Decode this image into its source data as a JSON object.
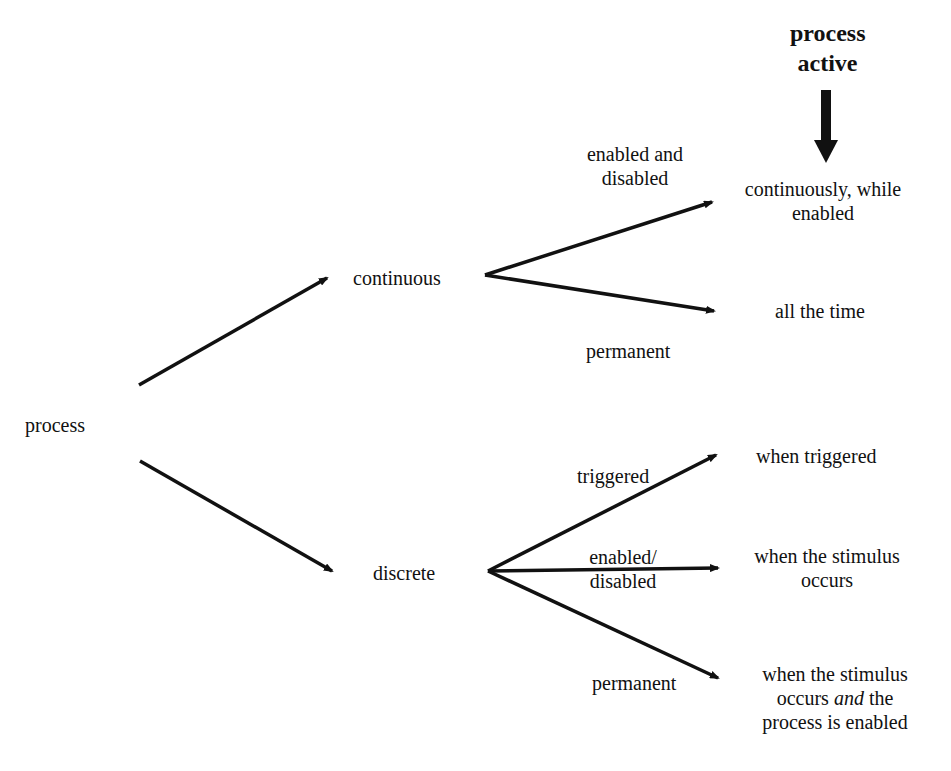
{
  "header": {
    "line1": "process",
    "line2": "active"
  },
  "nodes": {
    "root": "process",
    "continuous": "continuous",
    "discrete": "discrete"
  },
  "edges": {
    "enabled_and_disabled": {
      "line1": "enabled and",
      "line2": "disabled"
    },
    "cont_permanent": "permanent",
    "triggered": "triggered",
    "enabled_disabled": {
      "line1": "enabled/",
      "line2": "disabled"
    },
    "disc_permanent": "permanent"
  },
  "outcomes": {
    "cont_enabled": {
      "line1": "continuously, while",
      "line2": "enabled"
    },
    "all_time": "all the time",
    "when_triggered": "when  triggered",
    "stimulus": {
      "line1": "when the stimulus",
      "line2": "occurs"
    },
    "stimulus_enabled": {
      "line1": "when the  stimulus",
      "line2a": "occurs ",
      "line2_italic": "and",
      "line2b": " the",
      "line3": "process  is enabled"
    }
  }
}
